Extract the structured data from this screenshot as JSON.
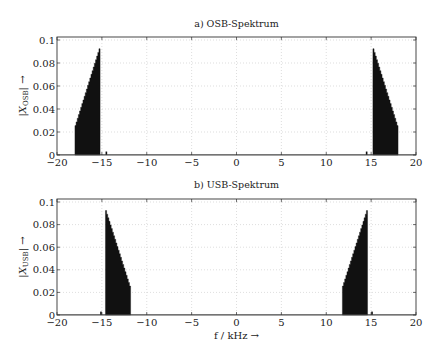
{
  "chart_data": [
    {
      "type": "bar",
      "title": "a) OSB-Spektrum",
      "xlabel": "",
      "ylabel": "|X_OSB| →",
      "xlim": [
        -20,
        20
      ],
      "ylim": [
        0,
        0.1
      ],
      "grid": true,
      "xticks": [
        "−20",
        "−15",
        "−10",
        "−5",
        "0",
        "5",
        "10",
        "15",
        "20"
      ],
      "yticks": [
        "0",
        "0.02",
        "0.04",
        "0.06",
        "0.08",
        "0.1"
      ],
      "bands": [
        {
          "f_start": -18.0,
          "f_end": -15.2,
          "amp_at_start": 0.024,
          "amp_at_end": 0.094
        },
        {
          "f_start": 15.2,
          "f_end": 18.0,
          "amp_at_start": 0.094,
          "amp_at_end": 0.024
        }
      ],
      "spikes": [
        {
          "f": -14.5,
          "amp": 0.003
        },
        {
          "f": 14.5,
          "amp": 0.003
        }
      ]
    },
    {
      "type": "bar",
      "title": "b) USB-Spektrum",
      "xlabel": "f / kHz →",
      "ylabel": "|X_USB| →",
      "xlim": [
        -20,
        20
      ],
      "ylim": [
        0,
        0.1
      ],
      "grid": true,
      "xticks": [
        "−20",
        "−15",
        "−10",
        "−5",
        "0",
        "5",
        "10",
        "15",
        "20"
      ],
      "yticks": [
        "0",
        "0.02",
        "0.04",
        "0.06",
        "0.08",
        "0.1"
      ],
      "bands": [
        {
          "f_start": -14.6,
          "f_end": -11.8,
          "amp_at_start": 0.094,
          "amp_at_end": 0.024
        },
        {
          "f_start": 11.8,
          "f_end": 14.6,
          "amp_at_start": 0.024,
          "amp_at_end": 0.094
        }
      ],
      "spikes": [
        {
          "f": -15.1,
          "amp": 0.003
        },
        {
          "f": 15.1,
          "amp": 0.003
        }
      ]
    }
  ],
  "plots": {
    "top": {
      "title": "a) OSB-Spektrum",
      "ylabel_main": "|X",
      "ylabel_sub": "OSB",
      "ylabel_tail": "| →"
    },
    "bottom": {
      "title": "b) USB-Spektrum",
      "ylabel_main": "|X",
      "ylabel_sub": "USB",
      "ylabel_tail": "| →",
      "xlabel": "f / kHz →"
    }
  }
}
